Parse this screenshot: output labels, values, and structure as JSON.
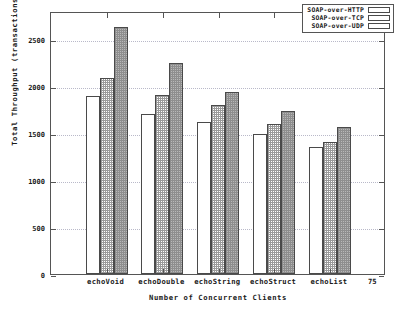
{
  "chart_data": {
    "type": "bar",
    "title": "",
    "xlabel": "Number of Concurrent Clients",
    "ylabel": "Total Throughput (transactions/s)",
    "categories": [
      "echoVoid",
      "echoDouble",
      "echoString",
      "echoStruct",
      "echoList"
    ],
    "series": [
      {
        "name": "SOAP-over-HTTP",
        "values": [
          1890,
          1700,
          1620,
          1495,
          1355
        ],
        "fill": "empty",
        "color": "#ffffff"
      },
      {
        "name": "SOAP-over-TCP",
        "values": [
          2090,
          1905,
          1795,
          1595,
          1405
        ],
        "fill": "light-crosshatch",
        "color": "#d8d8d8"
      },
      {
        "name": "SOAP-over-UDP",
        "values": [
          2630,
          2245,
          1940,
          1740,
          1565
        ],
        "fill": "dense-gray",
        "color": "#b8b8b8"
      }
    ],
    "ylim": [
      0,
      2800
    ],
    "yticks": [
      0,
      500,
      1000,
      1500,
      2000,
      2500
    ],
    "ytick_labels": [
      "0",
      "500",
      "1000",
      "1500",
      "2000",
      "2500"
    ],
    "x_axis_end_label": "75",
    "grid": true,
    "legend_position": "top-right"
  }
}
